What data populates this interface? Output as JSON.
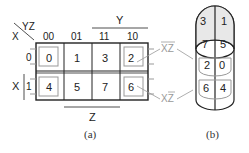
{
  "kmap": {
    "corner_col_var": "YZ",
    "corner_row_var": "X",
    "col_headers": [
      "00",
      "01",
      "11",
      "10"
    ],
    "row_headers": [
      "0",
      "1"
    ],
    "cells": [
      [
        "0",
        "1",
        "3",
        "2"
      ],
      [
        "4",
        "5",
        "7",
        "6"
      ]
    ],
    "group_labels": {
      "top": "Y",
      "bottom": "Z",
      "left": "X"
    },
    "loop_labels": [
      "XZ",
      "XZ"
    ],
    "caption": "(a)"
  },
  "cylinder": {
    "top_cells": [
      "3",
      "1"
    ],
    "mid_cells": [
      "7",
      "5"
    ],
    "row2_cells": [
      "2",
      "0"
    ],
    "row3_cells": [
      "6",
      "4"
    ],
    "caption": "(b)"
  },
  "colors": {
    "line": "#222222",
    "loop": "#999999",
    "shade": "#e8e8e8"
  }
}
